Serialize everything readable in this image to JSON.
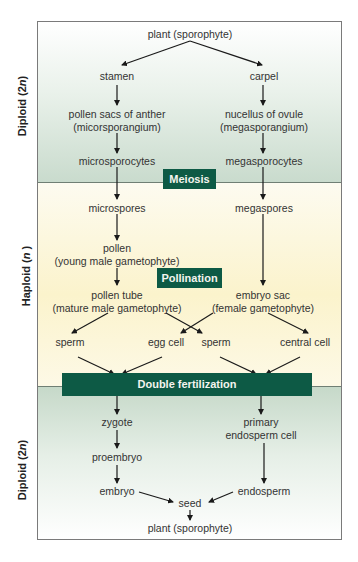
{
  "zones": {
    "top": {
      "label": "Diploid (2",
      "n": "n",
      "suffix": ")"
    },
    "middle": {
      "label": "Haploid (",
      "n": "n",
      "suffix": " )"
    },
    "bottom": {
      "label": "Diploid (2",
      "n": "n",
      "suffix": ")"
    }
  },
  "banners": {
    "meiosis": "Meiosis",
    "pollination": "Pollination",
    "double_fertilization": "Double fertilization"
  },
  "nodes": {
    "plant_top": "plant (sporophyte)",
    "stamen": "stamen",
    "carpel": "carpel",
    "pollen_sacs_1": "pollen sacs of anther",
    "pollen_sacs_2": "(micorsporangium)",
    "nucellus_1": "nucellus of ovule",
    "nucellus_2": "(megasporangium)",
    "microsporocytes": "microsporocytes",
    "megasporocytes": "megasporocytes",
    "microspores": "microspores",
    "megaspores": "megaspores",
    "pollen_1": "pollen",
    "pollen_2": "(young male gametophyte)",
    "pollen_tube_1": "pollen tube",
    "pollen_tube_2": "(mature male gametophyte)",
    "embryo_sac_1": "embryo sac",
    "embryo_sac_2": "(female gametophyte)",
    "sperm_left": "sperm",
    "egg_cell": "egg cell",
    "sperm_right": "sperm",
    "central_cell": "central cell",
    "zygote": "zygote",
    "primary_endosperm_1": "primary",
    "primary_endosperm_2": "endosperm cell",
    "proembryo": "proembryo",
    "embryo": "embryo",
    "endosperm": "endosperm",
    "seed": "seed",
    "plant_bottom": "plant (sporophyte)"
  },
  "colors": {
    "banner": "#0d5a45",
    "diploid_tint": "#c9dbcd",
    "haploid_tint": "#fbf3cc"
  }
}
